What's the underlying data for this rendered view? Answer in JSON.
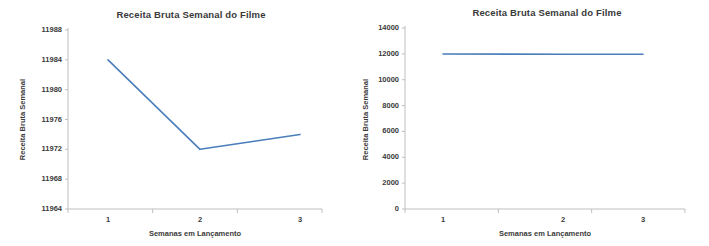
{
  "figure": {
    "width": 709,
    "height": 246,
    "background": "#ffffff",
    "line_color": "#4A7EBB",
    "axis_color": "#BFBFBF",
    "text_color": "#3A3A3A"
  },
  "chart_data": [
    {
      "type": "line",
      "id": "left-chart",
      "title": "Receita Bruta Semanal do Filme",
      "xlabel": "Semanas em Lançamento",
      "ylabel": "Receita Bruta Semanal",
      "categories": [
        "1",
        "2",
        "3"
      ],
      "x": [
        1,
        2,
        3
      ],
      "values": [
        11984,
        11972,
        11974
      ],
      "series": [
        {
          "name": "Receita Bruta Semanal",
          "values": [
            11984,
            11972,
            11974
          ]
        }
      ],
      "ylim": [
        11964,
        11988
      ],
      "yticks": [
        11964,
        11968,
        11972,
        11976,
        11980,
        11984,
        11988
      ],
      "ytick_labels": [
        "11964",
        "11968",
        "11972",
        "11976",
        "11980",
        "11984",
        "11988"
      ],
      "xticks": [
        1,
        2,
        3
      ],
      "xtick_labels": [
        "1",
        "2",
        "3"
      ],
      "grid": false,
      "legend": null,
      "legend_position": "none",
      "markers": false
    },
    {
      "type": "line",
      "id": "right-chart",
      "title": "Receita Bruta Semanal do Filme",
      "xlabel": "Semanas em Lançamento",
      "ylabel": "Receita Bruta Semanal",
      "categories": [
        "1",
        "2",
        "3"
      ],
      "x": [
        1,
        2,
        3
      ],
      "values": [
        11984,
        11972,
        11974
      ],
      "series": [
        {
          "name": "Receita Bruta Semanal",
          "values": [
            11984,
            11972,
            11974
          ]
        }
      ],
      "ylim": [
        0,
        14000
      ],
      "yticks": [
        0,
        2000,
        4000,
        6000,
        8000,
        10000,
        12000,
        14000
      ],
      "ytick_labels": [
        "0",
        "2000",
        "4000",
        "6000",
        "8000",
        "10000",
        "12000",
        "14000"
      ],
      "xticks": [
        1,
        2,
        3
      ],
      "xtick_labels": [
        "1",
        "2",
        "3"
      ],
      "grid": false,
      "legend": null,
      "legend_position": "none",
      "markers": false
    }
  ]
}
